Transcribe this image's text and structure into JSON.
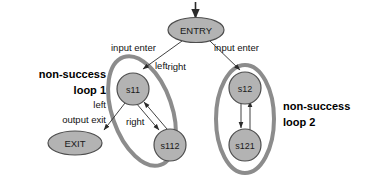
{
  "diagram": {
    "colors": {
      "node_fill": "#b3b3b3",
      "node_stroke": "#4d4d4d",
      "cluster_stroke": "#8c8c8c",
      "edge_stroke": "#2b2b2b",
      "text": "#111111",
      "background": "#ffffff"
    },
    "nodes": [
      {
        "id": "entry",
        "label": "ENTRY",
        "shape": "ellipse"
      },
      {
        "id": "s11",
        "label": "s11",
        "shape": "circle"
      },
      {
        "id": "s112",
        "label": "s112",
        "shape": "circle"
      },
      {
        "id": "exit",
        "label": "EXIT",
        "shape": "ellipse"
      },
      {
        "id": "s12",
        "label": "s12",
        "shape": "circle"
      },
      {
        "id": "s121",
        "label": "s121",
        "shape": "circle"
      }
    ],
    "edges": [
      {
        "id": "start-entry",
        "from": "start",
        "to": "entry",
        "label": ""
      },
      {
        "id": "entry-s11",
        "from": "entry",
        "to": "s11",
        "label": "input enter"
      },
      {
        "id": "entry-s11b",
        "from": "entry",
        "to": "s11",
        "label": "left"
      },
      {
        "id": "entry-s12",
        "from": "entry",
        "to": "s12",
        "label": "input enter"
      },
      {
        "id": "entry-s12b",
        "from": "entry",
        "to": "s12",
        "label": "right"
      },
      {
        "id": "s11-exit",
        "from": "s11",
        "to": "exit",
        "label": "left"
      },
      {
        "id": "s11-exitb",
        "from": "s11",
        "to": "exit",
        "label": "output exit"
      },
      {
        "id": "s11-s112",
        "from": "s11",
        "to": "s112",
        "label": "right"
      },
      {
        "id": "s112-s11",
        "from": "s112",
        "to": "s11",
        "label": ""
      },
      {
        "id": "s12-s121",
        "from": "s12",
        "to": "s121",
        "label": ""
      },
      {
        "id": "s121-s12",
        "from": "s121",
        "to": "s12",
        "label": ""
      }
    ],
    "clusters": [
      {
        "id": "loop1",
        "line1": "non-success",
        "line2": "loop 1",
        "members": [
          "s11",
          "s112"
        ]
      },
      {
        "id": "loop2",
        "line1": "non-success",
        "line2": "loop 2",
        "members": [
          "s12",
          "s121"
        ]
      }
    ],
    "labels": {
      "entry_left_edge": "input enter",
      "entry_right_edge": "input enter",
      "left_branch": "left",
      "right_branch": "right",
      "exit_left": "left",
      "exit_output": "output exit",
      "s11_s112": "right"
    }
  }
}
